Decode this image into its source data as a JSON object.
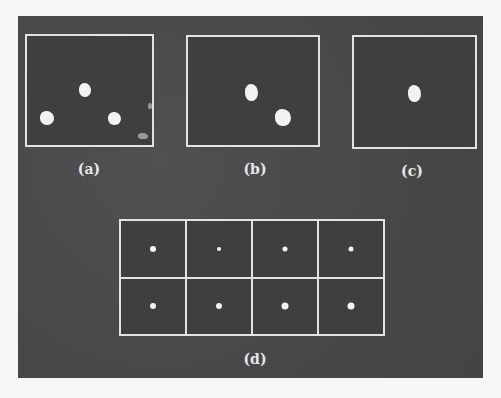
{
  "figure": {
    "panels": [
      {
        "id": "a",
        "label": "(a)",
        "blobs": [
          {
            "x": 85,
            "y": 90,
            "w": 12,
            "h": 14
          },
          {
            "x": 47,
            "y": 118,
            "w": 14,
            "h": 14
          },
          {
            "x": 114,
            "y": 118,
            "w": 13,
            "h": 13
          },
          {
            "x": 143,
            "y": 136,
            "w": 10,
            "h": 6,
            "faint": true
          },
          {
            "x": 150,
            "y": 106,
            "w": 4,
            "h": 6,
            "faint": true
          }
        ]
      },
      {
        "id": "b",
        "label": "(b)",
        "blobs": [
          {
            "x": 251,
            "y": 92,
            "w": 13,
            "h": 17
          },
          {
            "x": 283,
            "y": 117,
            "w": 16,
            "h": 17
          }
        ]
      },
      {
        "id": "c",
        "label": "(c)",
        "blobs": [
          {
            "x": 414,
            "y": 93,
            "w": 13,
            "h": 17
          }
        ]
      }
    ],
    "grid": {
      "label": "(d)",
      "rows": 2,
      "cols": 4,
      "dots": [
        {
          "row": 1,
          "col": 1,
          "size": 6
        },
        {
          "row": 1,
          "col": 2,
          "size": 4
        },
        {
          "row": 1,
          "col": 3,
          "size": 5
        },
        {
          "row": 1,
          "col": 4,
          "size": 5
        },
        {
          "row": 2,
          "col": 1,
          "size": 6
        },
        {
          "row": 2,
          "col": 2,
          "size": 6
        },
        {
          "row": 2,
          "col": 3,
          "size": 7
        },
        {
          "row": 2,
          "col": 4,
          "size": 7
        }
      ]
    }
  },
  "colors": {
    "background": "#4a4a4a",
    "frame": "#e2e2e2",
    "blob": "#f2f2f2",
    "page": "#f6f6f6"
  }
}
